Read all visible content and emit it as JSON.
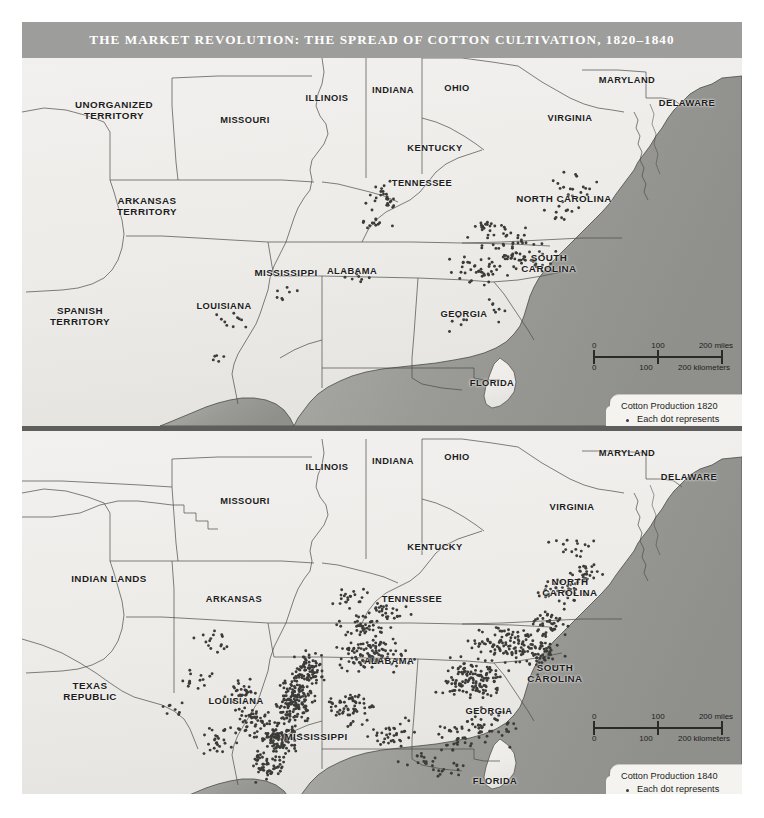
{
  "title": "THE MARKET REVOLUTION: THE SPREAD OF COTTON CULTIVATION, 1820–1840",
  "colors": {
    "title_bar": "#9d9d9b",
    "land": "#efeeec",
    "ocean": "#9a9a98",
    "border": "#4a4a48",
    "dot": "#3b3b39",
    "legend_bg": "#f4f3ef"
  },
  "panels": [
    {
      "id": "1820",
      "year": "1820",
      "labels": [
        {
          "text": "UNORGANIZED\nTERRITORY",
          "x": 92,
          "y": 52
        },
        {
          "text": "MISSOURI",
          "x": 223,
          "y": 62
        },
        {
          "text": "ILLINOIS",
          "x": 305,
          "y": 40
        },
        {
          "text": "INDIANA",
          "x": 371,
          "y": 32
        },
        {
          "text": "OHIO",
          "x": 435,
          "y": 30
        },
        {
          "text": "MARYLAND",
          "x": 605,
          "y": 22
        },
        {
          "text": "DELAWARE",
          "x": 665,
          "y": 45
        },
        {
          "text": "VIRGINIA",
          "x": 548,
          "y": 60
        },
        {
          "text": "KENTUCKY",
          "x": 413,
          "y": 90
        },
        {
          "text": "ARKANSAS\nTERRITORY",
          "x": 125,
          "y": 148
        },
        {
          "text": "TENNESSEE",
          "x": 400,
          "y": 125
        },
        {
          "text": "NORTH CAROLINA",
          "x": 542,
          "y": 141
        },
        {
          "text": "MISSISSIPPI",
          "x": 264,
          "y": 215
        },
        {
          "text": "ALABAMA",
          "x": 330,
          "y": 213
        },
        {
          "text": "SOUTH\nCAROLINA",
          "x": 527,
          "y": 205
        },
        {
          "text": "GEORGIA",
          "x": 442,
          "y": 256
        },
        {
          "text": "LOUISIANA",
          "x": 202,
          "y": 248
        },
        {
          "text": "SPANISH\nTERRITORY",
          "x": 58,
          "y": 258
        },
        {
          "text": "FLORIDA",
          "x": 470,
          "y": 325
        }
      ],
      "scalebar": {
        "x": 566,
        "y": 283
      },
      "legend": {
        "x": 588,
        "y": 336
      }
    },
    {
      "id": "1840",
      "year": "1840",
      "labels": [
        {
          "text": "ILLINOIS",
          "x": 305,
          "y": 28
        },
        {
          "text": "INDIANA",
          "x": 371,
          "y": 22
        },
        {
          "text": "OHIO",
          "x": 435,
          "y": 18
        },
        {
          "text": "MARYLAND",
          "x": 605,
          "y": 14
        },
        {
          "text": "DELAWARE",
          "x": 667,
          "y": 38
        },
        {
          "text": "MISSOURI",
          "x": 223,
          "y": 62
        },
        {
          "text": "VIRGINIA",
          "x": 550,
          "y": 68
        },
        {
          "text": "KENTUCKY",
          "x": 413,
          "y": 108
        },
        {
          "text": "INDIAN LANDS",
          "x": 87,
          "y": 140
        },
        {
          "text": "ARKANSAS",
          "x": 212,
          "y": 160
        },
        {
          "text": "TENNESSEE",
          "x": 390,
          "y": 160
        },
        {
          "text": "NORTH\nCAROLINA",
          "x": 548,
          "y": 148
        },
        {
          "text": "ALABAMA",
          "x": 367,
          "y": 222
        },
        {
          "text": "SOUTH\nCAROLINA",
          "x": 533,
          "y": 234
        },
        {
          "text": "GEORGIA",
          "x": 467,
          "y": 272
        },
        {
          "text": "TEXAS\nREPUBLIC",
          "x": 68,
          "y": 252
        },
        {
          "text": "LOUISIANA",
          "x": 214,
          "y": 262
        },
        {
          "text": "MISSISSIPPI",
          "x": 294,
          "y": 298
        },
        {
          "text": "FLORIDA",
          "x": 473,
          "y": 342
        }
      ],
      "scalebar": {
        "x": 566,
        "y": 281
      },
      "legend": {
        "x": 588,
        "y": 333
      }
    }
  ],
  "scalebar": {
    "miles": {
      "v0": "0",
      "v1": "100",
      "v2": "200 miles"
    },
    "kilometers": {
      "v0": "0",
      "v1": "100",
      "v2": "200 kilometers"
    }
  },
  "legend": {
    "title_1820": "Cotton Production 1820",
    "title_1840": "Cotton Production 1840",
    "entry": "Each dot represents\n2,000 bales of cotton"
  },
  "watermark": "",
  "chart_data": {
    "type": "map",
    "title": "The Market Revolution: The Spread of Cotton Cultivation, 1820–1840",
    "dot_value": 2000,
    "dot_unit": "bales of cotton",
    "panels": [
      {
        "year": 1820,
        "note": "Cotton production concentrated in the South Carolina / Georgia upcountry, middle Tennessee, and southern Virginia / North Carolina piedmont.",
        "regions": [
          {
            "name": "South Carolina upcountry",
            "dots": 95
          },
          {
            "name": "Georgia piedmont",
            "dots": 45
          },
          {
            "name": "Middle Tennessee",
            "dots": 30
          },
          {
            "name": "Virginia / North Carolina",
            "dots": 28
          },
          {
            "name": "Alabama",
            "dots": 14
          },
          {
            "name": "Mississippi",
            "dots": 8
          },
          {
            "name": "Louisiana",
            "dots": 12
          }
        ]
      },
      {
        "year": 1840,
        "note": "Cotton cultivation spread west into the Alabama-Mississippi Black Belt and the lower Mississippi River valley of Louisiana and Mississippi.",
        "regions": [
          {
            "name": "Mississippi River valley (LA/MS)",
            "dots": 330
          },
          {
            "name": "Alabama Black Belt",
            "dots": 180
          },
          {
            "name": "Georgia piedmont",
            "dots": 210
          },
          {
            "name": "South Carolina",
            "dots": 120
          },
          {
            "name": "North Carolina",
            "dots": 60
          },
          {
            "name": "Tennessee",
            "dots": 45
          },
          {
            "name": "Arkansas",
            "dots": 25
          },
          {
            "name": "Florida panhandle",
            "dots": 18
          }
        ]
      }
    ]
  }
}
